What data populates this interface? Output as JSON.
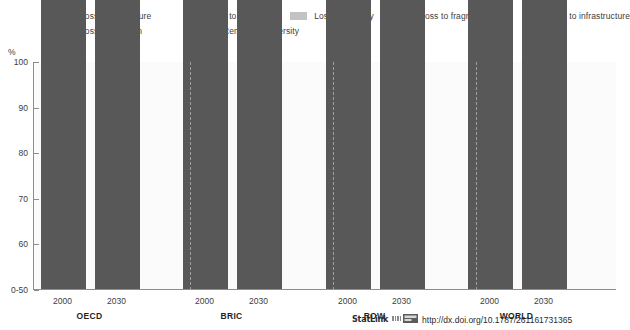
{
  "title_remnant": "",
  "legend": {
    "rows": [
      [
        {
          "label": "Loss to agriculture",
          "color": "#7f7f7f",
          "key": "agriculture"
        },
        {
          "label": "Loss to climate",
          "color": "#f2f2f2",
          "key": "climate"
        },
        {
          "label": "Loss to forestry",
          "color": "#c3c3c3",
          "key": "forestry"
        },
        {
          "label": "Loss to fragmentation",
          "color": "#1a1a1a",
          "key": "fragmentation"
        },
        {
          "label": "Loss to infrastructure",
          "color": "#e2e2e2",
          "key": "infrastructure"
        }
      ],
      [
        {
          "label": "Loss to nitrogen",
          "color": "#b0b0b0",
          "key": "nitrogen"
        },
        {
          "label": "Remaining diversity",
          "color": "#585858",
          "key": "remaining"
        }
      ]
    ]
  },
  "axis": {
    "unit": "%",
    "ticks": [
      "100",
      "90",
      "80",
      "70",
      "60",
      "0-50"
    ],
    "tick_values": [
      100,
      90,
      80,
      70,
      60,
      50
    ],
    "min": 50,
    "max": 100
  },
  "groups": [
    {
      "name": "OECD",
      "years": [
        "2000",
        "2030"
      ]
    },
    {
      "name": "BRIC",
      "years": [
        "2000",
        "2030"
      ]
    },
    {
      "name": "ROW",
      "years": [
        "2000",
        "2030"
      ]
    },
    {
      "name": "WORLD",
      "years": [
        "2000",
        "2030"
      ]
    }
  ],
  "footer": {
    "statlink": "StatLink",
    "icon": "statlink-barcode-icon",
    "url": "http://dx.doi.org/10.1787/261161731365"
  },
  "chart_data": {
    "type": "bar",
    "subtype": "stacked",
    "title": "",
    "xlabel": "",
    "ylabel": "%",
    "ylim": [
      50,
      100
    ],
    "yticks": [
      50,
      60,
      70,
      80,
      90,
      100
    ],
    "ytick_labels": [
      "0-50",
      "60",
      "70",
      "80",
      "90",
      "100"
    ],
    "grid": false,
    "legend_position": "top",
    "categories": [
      "OECD 2000",
      "OECD 2030",
      "BRIC 2000",
      "BRIC 2030",
      "ROW 2000",
      "ROW 2030",
      "WORLD 2000",
      "WORLD 2030"
    ],
    "series": [
      {
        "name": "Remaining diversity",
        "color": "#585858",
        "values": [
          70.5,
          65.0,
          72.5,
          64.8,
          74.0,
          66.0,
          73.2,
          66.2
        ]
      },
      {
        "name": "Loss to nitrogen",
        "color": "#b0b0b0",
        "values": [
          1.8,
          1.1,
          1.5,
          2.6,
          0.6,
          0.7,
          1.5,
          2.1
        ]
      },
      {
        "name": "Loss to infrastructure",
        "color": "#e2e2e2",
        "values": [
          5.4,
          7.1,
          4.5,
          7.2,
          4.2,
          7.5,
          4.5,
          7.0
        ]
      },
      {
        "name": "Loss to fragmentation",
        "color": "#1a1a1a",
        "values": [
          2.1,
          1.8,
          2.0,
          1.3,
          1.8,
          1.5,
          1.8,
          1.5
        ]
      },
      {
        "name": "Loss to forestry",
        "color": "#c3c3c3",
        "values": [
          2.4,
          2.5,
          0.6,
          1.1,
          0.4,
          0.5,
          0.7,
          0.8
        ]
      },
      {
        "name": "Loss to climate",
        "color": "#f2f2f2",
        "values": [
          1.3,
          3.1,
          1.3,
          4.2,
          1.3,
          4.2,
          1.3,
          4.0
        ]
      },
      {
        "name": "Loss to agriculture",
        "color": "#7f7f7f",
        "values": [
          16.5,
          19.4,
          17.6,
          18.8,
          17.7,
          19.6,
          17.0,
          18.4
        ]
      }
    ]
  }
}
